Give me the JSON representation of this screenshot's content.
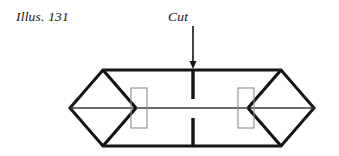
{
  "figure": {
    "illustration_label": "Illus. 131",
    "cut_label": "Cut",
    "colors": {
      "ink": "#141414",
      "thin_line": "#3a3a3a",
      "slot_outline": "#8a8a8a",
      "background": "#ffffff"
    }
  },
  "diagram": {
    "type": "paper-craft-fold-diagram",
    "annotations": [
      {
        "name": "illus-label",
        "text": "Illus. 131",
        "x": 16,
        "y": 9,
        "style": "italic"
      },
      {
        "name": "cut-label",
        "text": "Cut",
        "x": 168,
        "y": 9,
        "style": "italic"
      }
    ],
    "geometry": {
      "left_point": {
        "x": 70,
        "y": 108
      },
      "right_point": {
        "x": 314,
        "y": 108
      },
      "top_left_corner": {
        "x": 103,
        "y": 70
      },
      "top_right_corner": {
        "x": 281,
        "y": 70
      },
      "bottom_left_corner": {
        "x": 103,
        "y": 146
      },
      "bottom_right_corner": {
        "x": 281,
        "y": 146
      },
      "left_inner_vertex": {
        "x": 136,
        "y": 108
      },
      "right_inner_vertex": {
        "x": 248,
        "y": 108
      },
      "centre_line_y": 108,
      "slots": [
        {
          "name": "left-slot",
          "x": 131,
          "y": 88,
          "width": 16,
          "height": 40
        },
        {
          "name": "right-slot",
          "x": 238,
          "y": 88,
          "width": 16,
          "height": 40
        }
      ],
      "cut": {
        "x": 193,
        "upper_from_y": 70,
        "upper_to_y": 99,
        "lower_from_y": 118,
        "lower_to_y": 146
      },
      "arrow": {
        "x": 193,
        "from_y": 26,
        "to_y": 68,
        "head_width": 7,
        "head_length": 8
      }
    }
  }
}
